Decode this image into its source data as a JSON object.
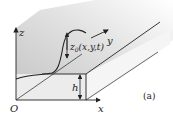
{
  "figure": {
    "panel_label": "(a)",
    "axes": {
      "x_label": "x",
      "y_label": "y",
      "z_label": "z",
      "origin_label": "O"
    },
    "annotations": {
      "surface_label": "z0(x,y,t)",
      "surface_label_base": "z",
      "surface_label_sub": "0",
      "surface_label_args": "(x,y,t)",
      "height_label": "h"
    },
    "colors": {
      "line": "#222222",
      "back_wall_dark": "#bdbdbd",
      "back_wall_light": "#f4f4f4",
      "block_face": "#ececec",
      "top_surface": "#f2f2f2"
    }
  }
}
